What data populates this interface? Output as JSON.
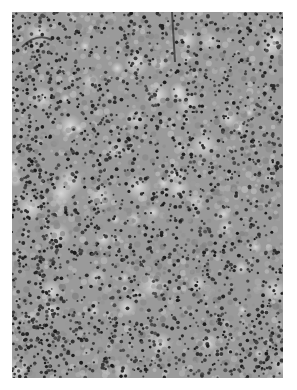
{
  "image": {
    "kind": "histology micrograph",
    "description": "Grayscale light micrograph of densely packed small round cells (lymphoid-type tissue) with scattered paler areas and darker nuclei",
    "color_mode": "grayscale",
    "background_color": "#ffffff",
    "tissue_base_color": "#9a9a9a",
    "nucleus_color": "#2a2a2a",
    "pale_region_color": "#d8d8d8"
  }
}
